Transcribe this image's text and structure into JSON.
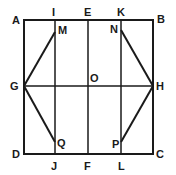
{
  "figure": {
    "type": "geometric-diagram",
    "stroke_color": "#1a1a1a",
    "background": "#ffffff"
  },
  "points": {
    "A": {
      "label": "A",
      "x": 24,
      "y": 20
    },
    "B": {
      "label": "B",
      "x": 153,
      "y": 20
    },
    "C": {
      "label": "C",
      "x": 153,
      "y": 154
    },
    "D": {
      "label": "D",
      "x": 24,
      "y": 154
    },
    "E": {
      "label": "E",
      "x": 88,
      "y": 20
    },
    "F": {
      "label": "F",
      "x": 88,
      "y": 154
    },
    "G": {
      "label": "G",
      "x": 24,
      "y": 86
    },
    "H": {
      "label": "H",
      "x": 153,
      "y": 86
    },
    "I": {
      "label": "I",
      "x": 55,
      "y": 20
    },
    "J": {
      "label": "J",
      "x": 55,
      "y": 154
    },
    "K": {
      "label": "K",
      "x": 121,
      "y": 20
    },
    "L": {
      "label": "L",
      "x": 121,
      "y": 154
    },
    "M": {
      "label": "M",
      "x": 55,
      "y": 32
    },
    "N": {
      "label": "N",
      "x": 121,
      "y": 30
    },
    "O": {
      "label": "O",
      "x": 88,
      "y": 86
    },
    "P": {
      "label": "P",
      "x": 121,
      "y": 142
    },
    "Q": {
      "label": "Q",
      "x": 55,
      "y": 142
    }
  },
  "segments": [
    [
      "A",
      "B"
    ],
    [
      "B",
      "C"
    ],
    [
      "C",
      "D"
    ],
    [
      "D",
      "A"
    ],
    [
      "I",
      "J"
    ],
    [
      "E",
      "F"
    ],
    [
      "K",
      "L"
    ],
    [
      "G",
      "H"
    ],
    [
      "G",
      "M"
    ],
    [
      "G",
      "Q"
    ],
    [
      "H",
      "N"
    ],
    [
      "H",
      "P"
    ]
  ]
}
